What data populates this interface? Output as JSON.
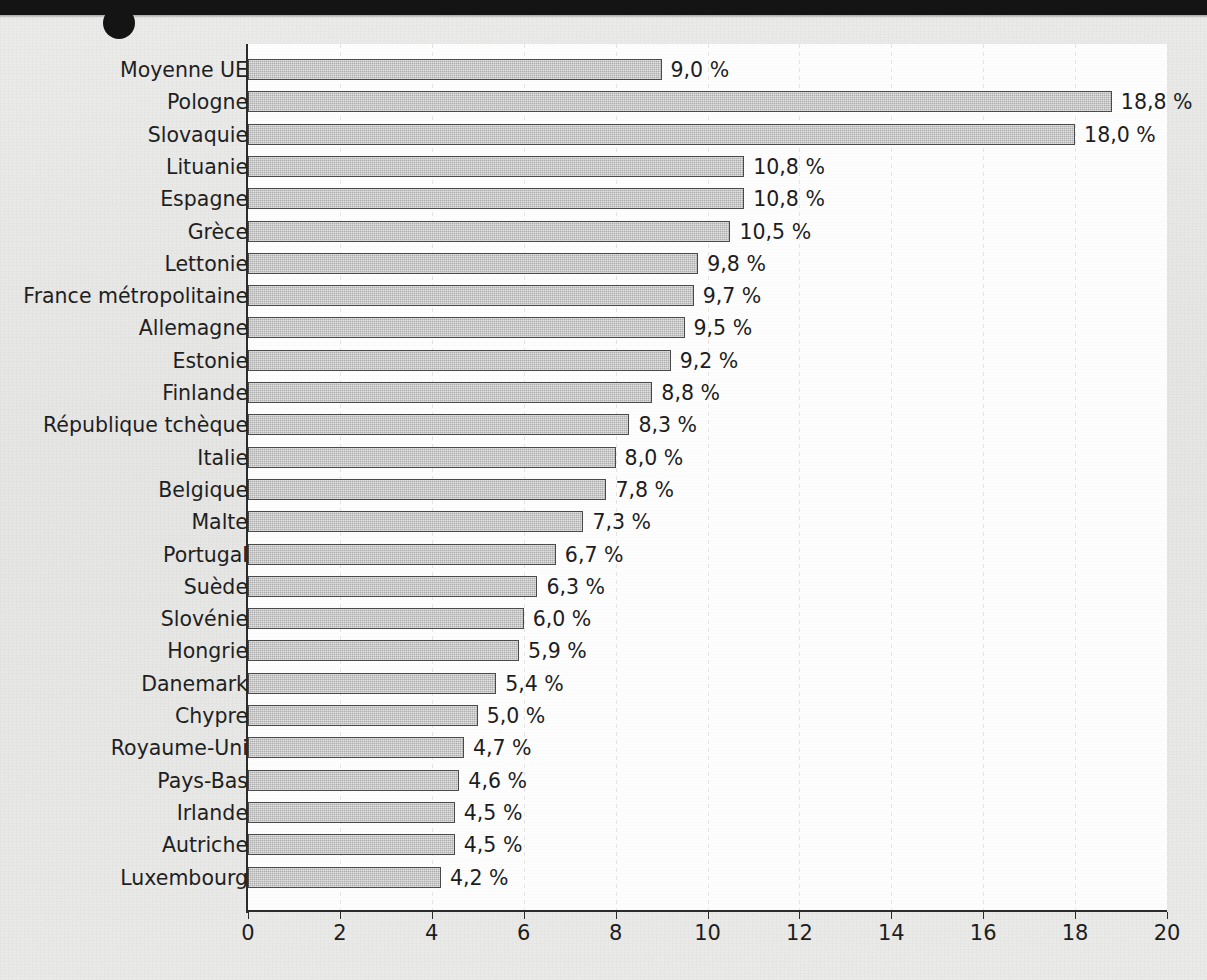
{
  "page": {
    "background_color": "#e8e8e6",
    "header_band_color": "#141414"
  },
  "chart_data": {
    "type": "bar",
    "orientation": "horizontal",
    "title": "",
    "subtitle": "",
    "xlabel": "",
    "ylabel": "",
    "xlim": [
      0,
      20
    ],
    "xticks": [
      0,
      2,
      4,
      6,
      8,
      10,
      12,
      14,
      16,
      18,
      20
    ],
    "xtick_labels": [
      "0",
      "2",
      "4",
      "6",
      "8",
      "10",
      "12",
      "14",
      "16",
      "18",
      "20"
    ],
    "grid": true,
    "grid_axis": "x",
    "legend": false,
    "value_label_suffix": " %",
    "decimal_separator": ",",
    "bar_fill_color": "#adadad",
    "bar_border_color": "#4a4a4a",
    "categories": [
      "Moyenne UE",
      "Pologne",
      "Slovaquie",
      "Lituanie",
      "Espagne",
      "Grèce",
      "Lettonie",
      "France métropolitaine",
      "Allemagne",
      "Estonie",
      "Finlande",
      "République tchèque",
      "Italie",
      "Belgique",
      "Malte",
      "Portugal",
      "Suède",
      "Slovénie",
      "Hongrie",
      "Danemark",
      "Chypre",
      "Royaume-Uni",
      "Pays-Bas",
      "Irlande",
      "Autriche",
      "Luxembourg"
    ],
    "values": [
      9.0,
      18.8,
      18.0,
      10.8,
      10.8,
      10.5,
      9.8,
      9.7,
      9.5,
      9.2,
      8.8,
      8.3,
      8.0,
      7.8,
      7.3,
      6.7,
      6.3,
      6.0,
      5.9,
      5.4,
      5.0,
      4.7,
      4.6,
      4.5,
      4.5,
      4.2
    ],
    "value_labels": [
      "9,0 %",
      "18,8 %",
      "18,0 %",
      "10,8 %",
      "10,8 %",
      "10,5 %",
      "9,8 %",
      "9,7 %",
      "9,5 %",
      "9,2 %",
      "8,8 %",
      "8,3 %",
      "8,0 %",
      "7,8 %",
      "7,3 %",
      "6,7 %",
      "6,3 %",
      "6,0 %",
      "5,9 %",
      "5,4 %",
      "5,0 %",
      "4,7 %",
      "4,6 %",
      "4,5 %",
      "4,5 %",
      "4,2 %"
    ]
  }
}
